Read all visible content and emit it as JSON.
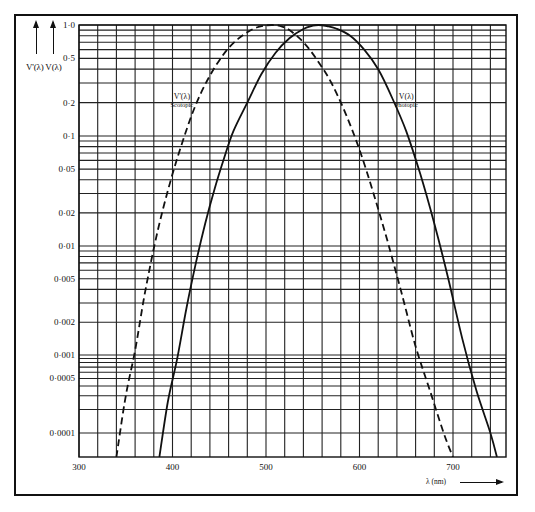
{
  "chart_data": {
    "type": "line",
    "title": "",
    "xlabel": "λ (nm)",
    "ylabel": "V'(λ) V(λ)",
    "x_scale": "linear",
    "y_scale": "log",
    "xlim": [
      300,
      755
    ],
    "ylim": [
      6e-05,
      1.0
    ],
    "grid": true,
    "legend": "inline labels",
    "x_ticks": [
      300,
      400,
      500,
      600,
      700
    ],
    "x_tick_labels": [
      "300",
      "400",
      "500",
      "600",
      "700"
    ],
    "y_ticks": [
      1.0,
      0.5,
      0.2,
      0.1,
      0.05,
      0.02,
      0.01,
      0.005,
      0.002,
      0.001,
      0.0005,
      0.0001
    ],
    "y_tick_labels": [
      "1·0",
      "0·5",
      "0·2",
      "0·1",
      "0·05",
      "0·02",
      "0·01",
      "0·005",
      "0·002",
      "0·001",
      "0·0005",
      "0·0001"
    ],
    "series": [
      {
        "name": "V'(λ) Scotopic",
        "style": "dashed",
        "x": [
          340,
          360,
          380,
          400,
          420,
          440,
          460,
          480,
          500,
          507,
          520,
          540,
          560,
          580,
          600,
          620,
          640,
          660,
          680,
          700
        ],
        "y": [
          6e-05,
          0.0006,
          0.0059,
          0.0093,
          0.0966,
          0.328,
          0.567,
          0.793,
          0.982,
          1.0,
          0.935,
          0.65,
          0.329,
          0.1212,
          0.03315,
          0.00737,
          0.001497,
          0.000313,
          7.16e-05,
          6e-05
        ]
      },
      {
        "name": "V(λ) Photopic",
        "style": "solid",
        "x": [
          386,
          400,
          420,
          440,
          460,
          480,
          500,
          520,
          540,
          555,
          560,
          580,
          600,
          620,
          640,
          660,
          680,
          700,
          720,
          740,
          747
        ],
        "y": [
          6e-05,
          0.0004,
          0.004,
          0.023,
          0.06,
          0.139,
          0.323,
          0.71,
          0.954,
          1.0,
          0.995,
          0.87,
          0.631,
          0.381,
          0.175,
          0.061,
          0.017,
          0.0041,
          0.00105,
          0.00025,
          6e-05
        ]
      }
    ],
    "annotations": [
      {
        "text": "V'(λ)",
        "sub": "Scotopic",
        "x_nm": 410,
        "y_val": 0.22
      },
      {
        "text": "V(λ)",
        "sub": "Photopic",
        "x_nm": 650,
        "y_val": 0.22
      }
    ]
  },
  "labels": {
    "y_axis": "V'(λ) V(λ)",
    "x_axis": "λ (nm)",
    "scotopic_name": "V'(λ)",
    "scotopic_sub": "Scotopic",
    "photopic_name": "V(λ)",
    "photopic_sub": "Photopic"
  }
}
